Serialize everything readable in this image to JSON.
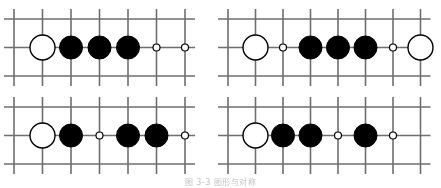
{
  "figure": {
    "caption": "图 3-3   图形与对称",
    "caption_visible_fragment": "图 3-3",
    "board_line_color": "#6e6e6e",
    "black_stone_color": "#000000",
    "white_stone_color": "#ffffff",
    "background_color": "#ffffff",
    "panel_count": 4
  },
  "panels": [
    {
      "id": "panel-top-left",
      "position": "top-left",
      "grid": {
        "columns": 7,
        "rows": 3,
        "x_origin": 14,
        "y_origin": 19,
        "spacing_x": 28.5,
        "spacing_y": 28.5,
        "line_overhang": 10
      },
      "stone_row_index": 1,
      "stones": [
        {
          "column": 1,
          "type": "white",
          "label": "white-stone"
        },
        {
          "column": 2,
          "type": "black",
          "label": "black-stone"
        },
        {
          "column": 3,
          "type": "black",
          "label": "black-stone"
        },
        {
          "column": 4,
          "type": "black",
          "label": "black-stone"
        },
        {
          "column": 5,
          "type": "empty-point",
          "label": "empty-intersection-marker"
        },
        {
          "column": 6,
          "type": "empty-point",
          "label": "empty-intersection-marker"
        }
      ]
    },
    {
      "id": "panel-top-right",
      "position": "top-right",
      "grid": {
        "columns": 8,
        "rows": 3,
        "x_origin": 228,
        "y_origin": 19,
        "spacing_x": 27.5,
        "spacing_y": 28.5,
        "line_overhang": 10
      },
      "stone_row_index": 1,
      "stones": [
        {
          "column": 1,
          "type": "white",
          "label": "white-stone"
        },
        {
          "column": 2,
          "type": "empty-point",
          "label": "empty-intersection-marker"
        },
        {
          "column": 3,
          "type": "black",
          "label": "black-stone"
        },
        {
          "column": 4,
          "type": "black",
          "label": "black-stone"
        },
        {
          "column": 5,
          "type": "black",
          "label": "black-stone"
        },
        {
          "column": 6,
          "type": "empty-point",
          "label": "empty-intersection-marker"
        },
        {
          "column": 7,
          "type": "white",
          "label": "white-stone"
        }
      ]
    },
    {
      "id": "panel-bottom-left",
      "position": "bottom-left",
      "grid": {
        "columns": 7,
        "rows": 3,
        "x_origin": 14,
        "y_origin": 107,
        "spacing_x": 28.5,
        "spacing_y": 28.5,
        "line_overhang": 10
      },
      "stone_row_index": 1,
      "stones": [
        {
          "column": 1,
          "type": "white",
          "label": "white-stone"
        },
        {
          "column": 2,
          "type": "black",
          "label": "black-stone"
        },
        {
          "column": 3,
          "type": "empty-point",
          "label": "empty-intersection-marker"
        },
        {
          "column": 4,
          "type": "black",
          "label": "black-stone"
        },
        {
          "column": 5,
          "type": "black",
          "label": "black-stone"
        },
        {
          "column": 6,
          "type": "empty-point",
          "label": "empty-intersection-marker"
        }
      ]
    },
    {
      "id": "panel-bottom-right",
      "position": "bottom-right",
      "grid": {
        "columns": 8,
        "rows": 3,
        "x_origin": 228,
        "y_origin": 107,
        "spacing_x": 27.5,
        "spacing_y": 28.5,
        "line_overhang": 10
      },
      "stone_row_index": 1,
      "stones": [
        {
          "column": 1,
          "type": "white",
          "label": "white-stone"
        },
        {
          "column": 2,
          "type": "black",
          "label": "black-stone"
        },
        {
          "column": 3,
          "type": "black",
          "label": "black-stone"
        },
        {
          "column": 4,
          "type": "empty-point",
          "label": "empty-intersection-marker"
        },
        {
          "column": 5,
          "type": "black",
          "label": "black-stone"
        },
        {
          "column": 6,
          "type": "empty-point",
          "label": "empty-intersection-marker"
        }
      ]
    }
  ],
  "stone_sizes": {
    "white_radius": 12.5,
    "black_radius": 11.5,
    "empty_point_radius": 3.5
  }
}
